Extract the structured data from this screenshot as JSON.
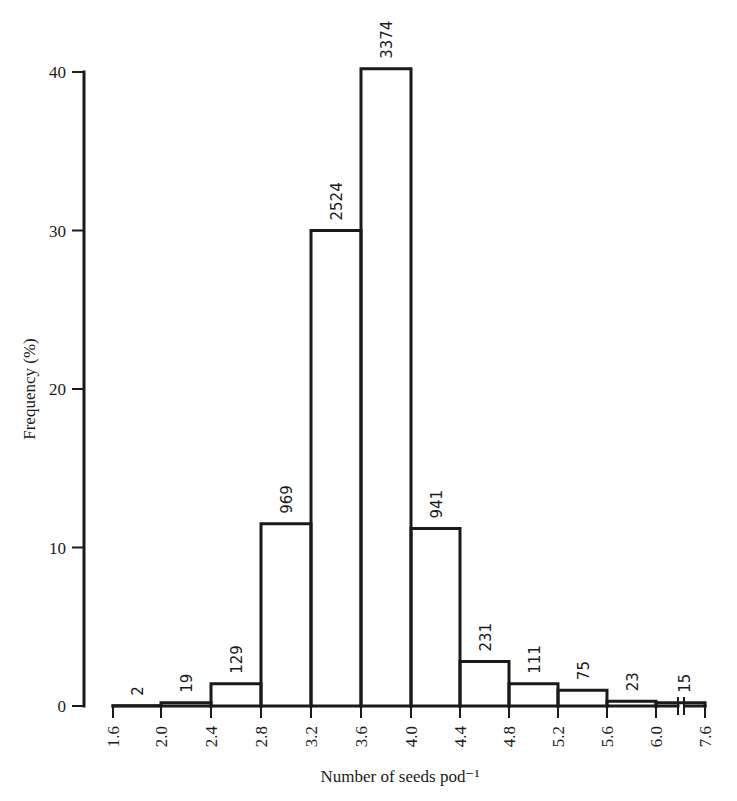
{
  "chart_data": {
    "type": "bar",
    "title": "",
    "xlabel": "Number of seeds pod⁻¹",
    "ylabel": "Frequency (%)",
    "ylim": [
      0,
      40
    ],
    "yticks": [
      0,
      10,
      20,
      30,
      40
    ],
    "xticks": [
      "1.6",
      "2.0",
      "2.4",
      "2.8",
      "3.2",
      "3.6",
      "4.0",
      "4.4",
      "4.8",
      "5.2",
      "5.6",
      "6.0",
      "7.6"
    ],
    "grid": false,
    "legend": null,
    "bins": [
      {
        "from": 1.6,
        "to": 2.0,
        "percent": 0.02,
        "count": "2"
      },
      {
        "from": 2.0,
        "to": 2.4,
        "percent": 0.2,
        "count": "19"
      },
      {
        "from": 2.4,
        "to": 2.8,
        "percent": 1.4,
        "count": "129"
      },
      {
        "from": 2.8,
        "to": 3.2,
        "percent": 11.5,
        "count": "969"
      },
      {
        "from": 3.2,
        "to": 3.6,
        "percent": 30.0,
        "count": "2524"
      },
      {
        "from": 3.6,
        "to": 4.0,
        "percent": 40.2,
        "count": "3374"
      },
      {
        "from": 4.0,
        "to": 4.4,
        "percent": 11.2,
        "count": "941"
      },
      {
        "from": 4.4,
        "to": 4.8,
        "percent": 2.8,
        "count": "231"
      },
      {
        "from": 4.8,
        "to": 5.2,
        "percent": 1.4,
        "count": "111"
      },
      {
        "from": 5.2,
        "to": 5.6,
        "percent": 1.0,
        "count": "75"
      },
      {
        "from": 5.6,
        "to": 6.0,
        "percent": 0.3,
        "count": "23"
      },
      {
        "from": 6.0,
        "to": 7.6,
        "percent": 0.2,
        "count": "15",
        "axis_break": true
      }
    ],
    "categories": [
      "1.6-2.0",
      "2.0-2.4",
      "2.4-2.8",
      "2.8-3.2",
      "3.2-3.6",
      "3.6-4.0",
      "4.0-4.4",
      "4.4-4.8",
      "4.8-5.2",
      "5.2-5.6",
      "5.6-6.0",
      "6.0-7.6"
    ],
    "values": [
      0.02,
      0.2,
      1.4,
      11.5,
      30.0,
      40.2,
      11.2,
      2.8,
      1.4,
      1.0,
      0.3,
      0.2
    ],
    "annotations": [
      "2",
      "19",
      "129",
      "969",
      "2524",
      "3374",
      "941",
      "231",
      "111",
      "75",
      "23",
      "15"
    ]
  }
}
